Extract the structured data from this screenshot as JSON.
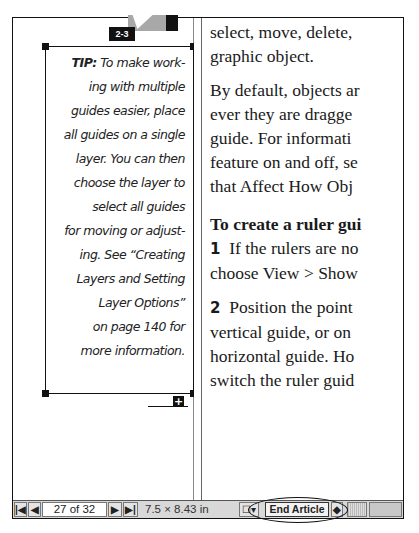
{
  "figure": {
    "label": "2-3"
  },
  "tip": {
    "label": "TIP:",
    "lines": [
      "To make work-",
      "ing with multiple",
      "guides easier, place",
      "all guides on a single",
      "layer. You can then",
      "choose the layer to",
      "select all guides",
      "for moving or adjust-",
      "ing. See “Creating",
      "Layers and Setting",
      "Layer Options”",
      "on page 140 for",
      "more information."
    ],
    "overflow_icon": "+"
  },
  "body": {
    "para1": [
      "select, move, delete,",
      "graphic object."
    ],
    "para2": [
      "By default, objects ar",
      "ever they are dragge",
      "guide. For informati",
      "feature on and off, se",
      "that Affect How Obj"
    ],
    "heading": "To create a ruler gui",
    "step1": {
      "num": "1",
      "lines": [
        "If the rulers are no",
        "choose View > Show"
      ]
    },
    "step2": {
      "num": "2",
      "lines": [
        "Position the point",
        "vertical guide, or on",
        "horizontal guide. Ho",
        "switch the ruler guid"
      ]
    }
  },
  "statusbar": {
    "first_page": "|◀",
    "prev_page": "◀",
    "page_indicator": "27 of 32",
    "next_page": "▶",
    "last_page": "▶|",
    "page_size": "7.5 × 8.43 in",
    "view_icon": "☐▾",
    "end_article": "End Article",
    "article_nav": "◆"
  }
}
